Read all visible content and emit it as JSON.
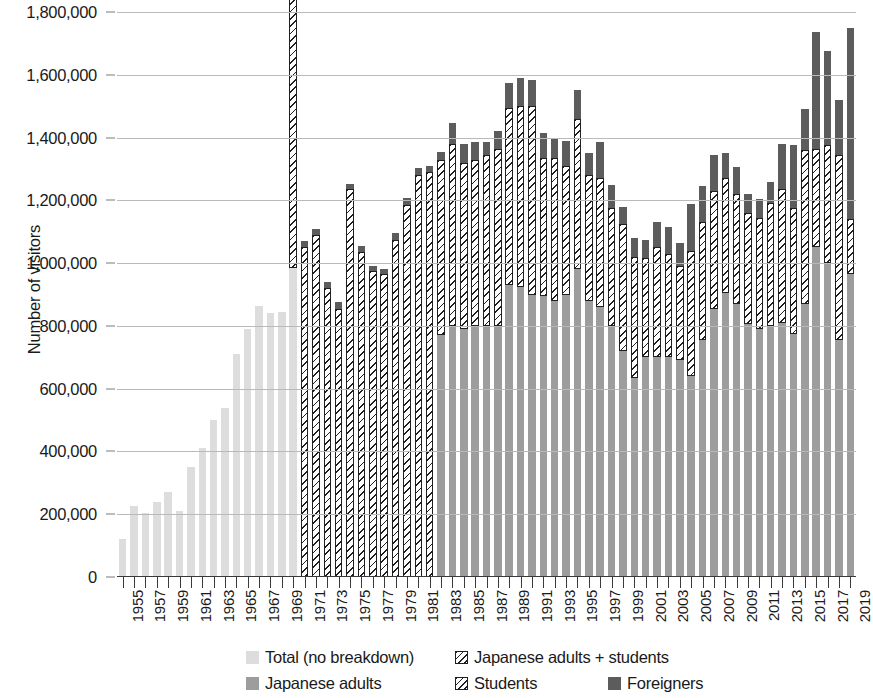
{
  "chart_data": {
    "type": "bar",
    "stacked": true,
    "title": "",
    "xlabel": "",
    "ylabel": "Number of visitors",
    "ylim": [
      0,
      1800000
    ],
    "ytick_step": 200000,
    "ytick_labels": [
      "0",
      "200,000",
      "400,000",
      "600,000",
      "800,000",
      "1,000,000",
      "1,200,000",
      "1,400,000",
      "1,600,000",
      "1,800,000"
    ],
    "ytick_values": [
      0,
      200000,
      400000,
      600000,
      800000,
      1000000,
      1200000,
      1400000,
      1600000,
      1800000
    ],
    "grid": "horizontal",
    "legend_position": "bottom",
    "x_label_interval": 2,
    "categories": [
      "1955",
      "1956",
      "1957",
      "1958",
      "1959",
      "1960",
      "1961",
      "1962",
      "1963",
      "1964",
      "1965",
      "1966",
      "1967",
      "1968",
      "1969",
      "1970",
      "1971",
      "1972",
      "1973",
      "1974",
      "1975",
      "1976",
      "1977",
      "1978",
      "1979",
      "1980",
      "1981",
      "1982",
      "1983",
      "1984",
      "1985",
      "1986",
      "1987",
      "1988",
      "1989",
      "1990",
      "1991",
      "1992",
      "1993",
      "1994",
      "1995",
      "1996",
      "1997",
      "1998",
      "1999",
      "2000",
      "2001",
      "2002",
      "2003",
      "2004",
      "2005",
      "2006",
      "2007",
      "2008",
      "2009",
      "2010",
      "2011",
      "2012",
      "2013",
      "2014",
      "2015",
      "2016",
      "2017",
      "2018",
      "2019"
    ],
    "xtick_labels": [
      "1955",
      "1957",
      "1959",
      "1961",
      "1963",
      "1965",
      "1967",
      "1969",
      "1971",
      "1973",
      "1975",
      "1977",
      "1979",
      "1981",
      "1983",
      "1985",
      "1987",
      "1989",
      "1991",
      "1993",
      "1995",
      "1997",
      "1999",
      "2001",
      "2003",
      "2005",
      "2007",
      "2009",
      "2011",
      "2013",
      "2015",
      "2017",
      "2019"
    ],
    "series": [
      {
        "name": "Total (no breakdown)",
        "key": "total",
        "color": "#dddddd",
        "pattern": "solid",
        "values": [
          120000,
          225000,
          205000,
          240000,
          270000,
          210000,
          350000,
          410000,
          500000,
          540000,
          710000,
          790000,
          865000,
          840000,
          845000,
          985000,
          null,
          null,
          null,
          null,
          null,
          null,
          null,
          null,
          null,
          null,
          null,
          null,
          null,
          null,
          null,
          null,
          null,
          null,
          null,
          null,
          null,
          null,
          null,
          null,
          null,
          null,
          null,
          null,
          null,
          null,
          null,
          null,
          null,
          null,
          null,
          null,
          null,
          null,
          null,
          null,
          null,
          null,
          null,
          null,
          null,
          null,
          null,
          null,
          null
        ]
      },
      {
        "name": "Japanese adults",
        "key": "adults",
        "color": "#9d9d9d",
        "pattern": "solid",
        "values": [
          null,
          null,
          null,
          null,
          null,
          null,
          null,
          null,
          null,
          null,
          null,
          null,
          null,
          null,
          null,
          null,
          null,
          null,
          null,
          null,
          null,
          null,
          null,
          null,
          null,
          null,
          null,
          null,
          770000,
          800000,
          790000,
          800000,
          800000,
          800000,
          930000,
          925000,
          900000,
          895000,
          880000,
          900000,
          980000,
          880000,
          860000,
          800000,
          720000,
          635000,
          700000,
          700000,
          700000,
          690000,
          640000,
          755000,
          855000,
          905000,
          870000,
          805000,
          790000,
          800000,
          810000,
          775000,
          870000,
          1050000,
          1000000,
          755000,
          965000
        ]
      },
      {
        "name": "Japanese adults + students",
        "key": "jas",
        "color": "#ffffff",
        "pattern": "diagonal-hatch",
        "values": [
          null,
          null,
          null,
          null,
          null,
          null,
          null,
          null,
          null,
          null,
          null,
          null,
          null,
          null,
          null,
          890000,
          1050000,
          1090000,
          920000,
          855000,
          1235000,
          1035000,
          975000,
          965000,
          1075000,
          1185000,
          1280000,
          1290000,
          null,
          null,
          null,
          null,
          null,
          null,
          null,
          null,
          null,
          null,
          null,
          null,
          null,
          null,
          null,
          null,
          null,
          null,
          null,
          null,
          null,
          null,
          null,
          null,
          null,
          null,
          null,
          null,
          null,
          null,
          null,
          null,
          null,
          null,
          null,
          null,
          null
        ]
      },
      {
        "name": "Students",
        "key": "students",
        "color": "#ffffff",
        "pattern": "diagonal-hatch",
        "values": [
          null,
          null,
          null,
          null,
          null,
          null,
          null,
          null,
          null,
          null,
          null,
          null,
          null,
          null,
          null,
          null,
          null,
          null,
          null,
          null,
          null,
          null,
          null,
          null,
          null,
          null,
          null,
          null,
          560000,
          580000,
          530000,
          530000,
          545000,
          565000,
          565000,
          575000,
          600000,
          440000,
          455000,
          410000,
          480000,
          400000,
          410000,
          375000,
          405000,
          385000,
          315000,
          350000,
          330000,
          300000,
          400000,
          375000,
          375000,
          365000,
          350000,
          355000,
          355000,
          390000,
          425000,
          400000,
          490000,
          315000,
          375000,
          590000,
          175000
        ]
      },
      {
        "name": "Foreigners",
        "key": "foreigners",
        "color": "#5c5c5c",
        "pattern": "solid",
        "values": [
          null,
          null,
          null,
          null,
          null,
          null,
          null,
          null,
          null,
          null,
          null,
          null,
          null,
          null,
          null,
          38000,
          22000,
          20000,
          20000,
          20000,
          18000,
          18000,
          15000,
          15000,
          22000,
          22000,
          22000,
          20000,
          25000,
          65000,
          60000,
          55000,
          40000,
          55000,
          80000,
          90000,
          85000,
          80000,
          60000,
          80000,
          90000,
          70000,
          115000,
          75000,
          55000,
          60000,
          60000,
          80000,
          85000,
          75000,
          150000,
          115000,
          115000,
          80000,
          85000,
          60000,
          60000,
          70000,
          145000,
          200000,
          130000,
          370000,
          300000,
          175000,
          610000
        ]
      }
    ]
  },
  "axis": {
    "ylabel": "Number of visitors"
  },
  "legend": {
    "items": [
      {
        "label": "Total (no breakdown)",
        "swatch": "sw-total"
      },
      {
        "label": "Japanese adults + students",
        "swatch": "sw-jas"
      },
      {
        "label": "Japanese adults",
        "swatch": "sw-adults"
      },
      {
        "label": "Students",
        "swatch": "sw-students"
      },
      {
        "label": "Foreigners",
        "swatch": "sw-foreign"
      }
    ]
  }
}
